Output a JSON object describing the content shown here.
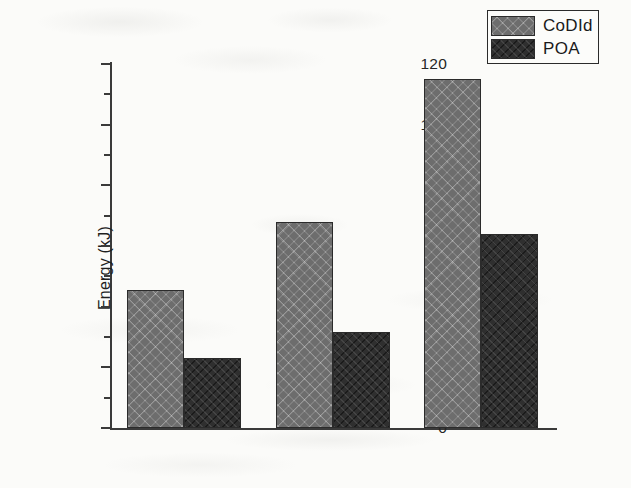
{
  "chart_data": {
    "type": "bar",
    "title": "",
    "subtitle": "",
    "xlabel": "",
    "ylabel": "Energy (kJ)",
    "categories": [
      "Low  overload",
      "Medium  overload",
      "High  overload"
    ],
    "series": [
      {
        "name": "CoDId",
        "values": [
          45.5,
          68,
          115
        ],
        "color": "#6d6d6d",
        "pattern": "crosshatch"
      },
      {
        "name": "POA",
        "values": [
          23,
          31.5,
          64
        ],
        "color": "#2f2f2f",
        "pattern": "diagonal-hatch"
      }
    ],
    "ylim": [
      0,
      120
    ],
    "ytick_labels": [
      "0",
      "20",
      "40",
      "60",
      "80",
      "100",
      "120"
    ],
    "ytick_values": [
      0,
      20,
      40,
      60,
      80,
      100,
      120
    ],
    "yminor_values": [
      10,
      30,
      50,
      70,
      90,
      110
    ],
    "grid": false,
    "legend_position": "top-right",
    "legend_entries": [
      "CoDId",
      "POA"
    ],
    "annotations": []
  },
  "axes": {
    "y_title": "Energy (kJ)"
  },
  "legend": {
    "items": [
      {
        "label": "CoDId",
        "swatch": "codid-swatch"
      },
      {
        "label": "POA",
        "swatch": "poa-swatch"
      }
    ]
  }
}
